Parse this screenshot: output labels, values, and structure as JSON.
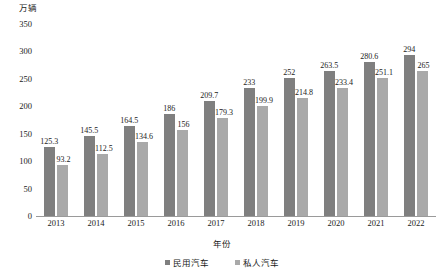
{
  "chart_data": {
    "type": "bar",
    "title": "",
    "unit_label": "万辆",
    "xlabel": "年份",
    "ylabel": "",
    "categories": [
      "2013",
      "2014",
      "2015",
      "2016",
      "2017",
      "2018",
      "2019",
      "2020",
      "2021",
      "2022"
    ],
    "series": [
      {
        "name": "民用汽车",
        "color": "#7f7f7f",
        "values": [
          125.3,
          145.5,
          164.5,
          186,
          209.7,
          233,
          252,
          263.5,
          280.6,
          294
        ],
        "labels": [
          "125.3",
          "145.5",
          "164.5",
          "186",
          "209.7",
          "233",
          "252",
          "263.5",
          "280.6",
          "294"
        ]
      },
      {
        "name": "私人汽车",
        "color": "#a9a9a9",
        "values": [
          93.2,
          112.5,
          134.6,
          156,
          179.3,
          199.9,
          214.8,
          233.4,
          251.1,
          265
        ],
        "labels": [
          "93.2",
          "112.5",
          "134.6",
          "156",
          "179.3",
          "199.9",
          "214.8",
          "233.4",
          "251.1",
          "265"
        ]
      }
    ],
    "ylim": [
      0,
      350
    ],
    "yticks": [
      0,
      50,
      100,
      150,
      200,
      250,
      300,
      350
    ],
    "ytick_labels": [
      "0",
      "50",
      "100",
      "150",
      "200",
      "250",
      "300",
      "350"
    ],
    "grid": false,
    "legend_position": "bottom"
  }
}
